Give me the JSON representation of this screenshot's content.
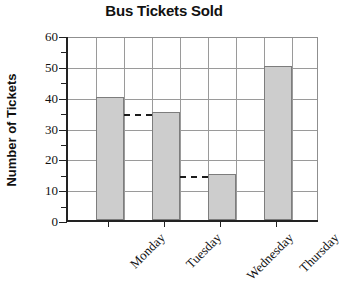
{
  "chart_data": {
    "type": "bar",
    "title": "Bus Tickets Sold",
    "xlabel": "",
    "ylabel": "Number of Tickets",
    "categories": [
      "Monday",
      "Tuesday",
      "Wednesday",
      "Thursday"
    ],
    "values": [
      40,
      35,
      15,
      50
    ],
    "ylim": [
      0,
      60
    ],
    "ytick_labels": [
      "0",
      "10",
      "20",
      "30",
      "40",
      "50",
      "60"
    ],
    "ytick_values": [
      0,
      10,
      20,
      30,
      40,
      50,
      60
    ],
    "yminor_values": [
      5,
      15,
      25,
      35,
      45,
      55
    ],
    "grid": "both",
    "legend": "none",
    "annotations": [
      {
        "type": "dashed-reference-line",
        "value": 35,
        "label": "35"
      },
      {
        "type": "dashed-reference-line",
        "value": 15,
        "label": "15"
      }
    ],
    "bar_fill_color": "#cdcdcd",
    "bar_border_color": "#7d7d7d",
    "grid_color": "#9a9a9a",
    "axis_color": "#222222"
  }
}
